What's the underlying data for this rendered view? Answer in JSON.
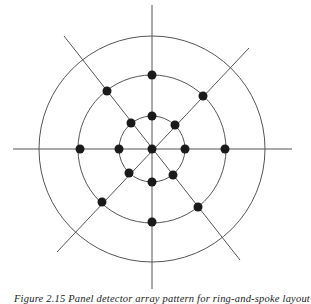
{
  "figure": {
    "center": [
      152,
      149
    ],
    "circles": [
      {
        "name": "inner",
        "radius": 33
      },
      {
        "name": "middle",
        "radius": 74
      },
      {
        "name": "outer",
        "radius": 113
      }
    ],
    "lines": [
      {
        "name": "horizontal-axis",
        "x1": 13,
        "y1": 149,
        "x2": 292,
        "y2": 149
      },
      {
        "name": "vertical-axis",
        "x1": 152,
        "y1": 5,
        "x2": 152,
        "y2": 289
      },
      {
        "name": "diagonal-upper-left-lower-right",
        "x1": 64,
        "y1": 36,
        "x2": 240,
        "y2": 260
      },
      {
        "name": "diagonal-upper-right-lower-left",
        "x1": 249,
        "y1": 48,
        "x2": 57,
        "y2": 252
      }
    ],
    "dots": [
      {
        "name": "center",
        "cx": 152,
        "cy": 149
      },
      {
        "name": "inner-top",
        "cx": 152,
        "cy": 116
      },
      {
        "name": "inner-bottom",
        "cx": 152,
        "cy": 182
      },
      {
        "name": "inner-left",
        "cx": 119,
        "cy": 149
      },
      {
        "name": "inner-right",
        "cx": 185,
        "cy": 149
      },
      {
        "name": "inner-upper-left",
        "cx": 131,
        "cy": 123
      },
      {
        "name": "inner-lower-right",
        "cx": 173,
        "cy": 175
      },
      {
        "name": "inner-upper-right",
        "cx": 175,
        "cy": 125
      },
      {
        "name": "inner-lower-left",
        "cx": 129,
        "cy": 173
      },
      {
        "name": "middle-top",
        "cx": 152,
        "cy": 75
      },
      {
        "name": "middle-bottom",
        "cx": 152,
        "cy": 222
      },
      {
        "name": "middle-left",
        "cx": 80,
        "cy": 149
      },
      {
        "name": "middle-right",
        "cx": 225,
        "cy": 149
      },
      {
        "name": "middle-upper-left",
        "cx": 107,
        "cy": 91
      },
      {
        "name": "middle-lower-right",
        "cx": 198,
        "cy": 207
      },
      {
        "name": "middle-upper-right",
        "cx": 203,
        "cy": 96
      },
      {
        "name": "middle-lower-left",
        "cx": 102,
        "cy": 202
      }
    ],
    "dot_radius": 4.5,
    "stroke_color": "#555555",
    "dot_color": "#1a1a1a"
  },
  "caption": "Figure 2.15  Panel detector array pattern for ring-and-spoke layout"
}
